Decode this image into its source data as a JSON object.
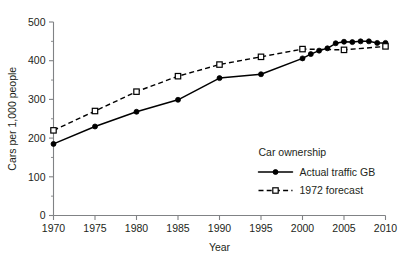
{
  "chart_data": {
    "type": "line",
    "title": "",
    "xlabel": "Year",
    "ylabel": "Cars per 1,000 people",
    "xlim": [
      1970,
      2010
    ],
    "ylim": [
      0,
      500
    ],
    "grid": false,
    "legend_position": "inside-lower-right",
    "legend_title": "Car ownership",
    "y_ticks": [
      0,
      100,
      200,
      300,
      400,
      500
    ],
    "y_tick_labels": [
      "0",
      "100",
      "200",
      "300",
      "400",
      "500"
    ],
    "y_minor_ticks": [
      50,
      150,
      250,
      350,
      450
    ],
    "x_ticks": [
      1970,
      1975,
      1980,
      1985,
      1990,
      1995,
      2000,
      2005,
      2010
    ],
    "x_tick_labels": [
      "1970",
      "1975",
      "1980",
      "1985",
      "1990",
      "1995",
      "2000",
      "2005",
      "2010"
    ],
    "series": [
      {
        "name": "Actual traffic GB",
        "marker": "filled-circle",
        "linestyle": "solid",
        "color": "#000000",
        "x": [
          1970,
          1975,
          1980,
          1985,
          1990,
          1995,
          2000,
          2001,
          2002,
          2003,
          2004,
          2005,
          2006,
          2007,
          2008,
          2009,
          2010
        ],
        "values": [
          185,
          230,
          268,
          299,
          355,
          365,
          406,
          417,
          426,
          432,
          445,
          449,
          448,
          450,
          450,
          446,
          446
        ]
      },
      {
        "name": "1972 forecast",
        "marker": "open-square",
        "linestyle": "dashed",
        "color": "#000000",
        "x": [
          1970,
          1975,
          1980,
          1985,
          1990,
          1995,
          2000,
          2005,
          2010
        ],
        "values": [
          220,
          270,
          320,
          360,
          390,
          410,
          430,
          428,
          437
        ]
      }
    ]
  },
  "legend": {
    "title": "Car ownership",
    "entries": [
      {
        "label": "Actual traffic GB",
        "marker": "filled-circle",
        "linestyle": "solid"
      },
      {
        "label": "1972 forecast",
        "marker": "open-square",
        "linestyle": "dashed"
      }
    ]
  },
  "axes": {
    "x_title": "Year",
    "y_title": "Cars per 1,000 people"
  }
}
